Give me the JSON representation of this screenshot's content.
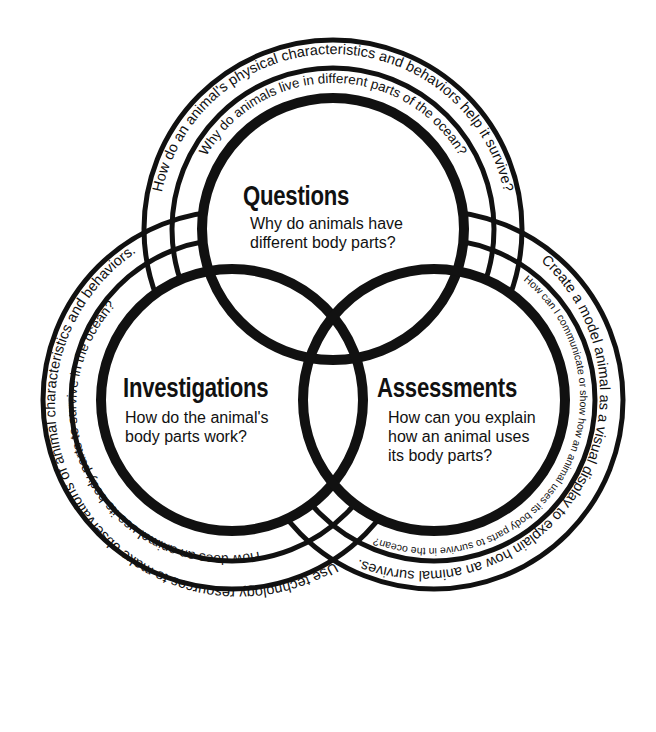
{
  "diagram": {
    "type": "three-circle venn diagram",
    "colors": {
      "stroke": "#111111",
      "background": "#ffffff"
    },
    "circles": [
      {
        "id": "questions",
        "title": "Questions",
        "description": "Why do animals have\ndifferent body parts?",
        "outer_ring_text": "How do an animal's physical characteristics and behaviors help it survive?",
        "inner_ring_text": "Why do animals live in different parts of the ocean?"
      },
      {
        "id": "investigations",
        "title": "Investigations",
        "description": "How do the animal's\nbody parts work?",
        "outer_ring_text": "Use technology resources to make observations of animal characteristics and behaviors.",
        "inner_ring_text": "How does an animal use its body parts to survive in the ocean?"
      },
      {
        "id": "assessments",
        "title": "Assessments",
        "description": "How can you explain\nhow an animal uses\nits body parts?",
        "outer_ring_text": "Create a model animal as a visual display to explain how an animal survives.",
        "inner_ring_text": "How can I communicate or show how an animal uses its body parts to survive in the ocean?"
      }
    ]
  }
}
